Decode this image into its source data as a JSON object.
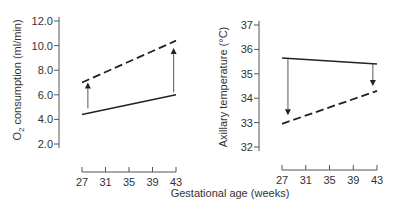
{
  "chart_data": [
    {
      "type": "line",
      "title": "",
      "xlabel": "Gestational age (weeks)",
      "ylabel": "O2 consumption (ml/min)",
      "ylabel_display": [
        "O",
        "2",
        " consumption (ml/min)"
      ],
      "x_ticks": [
        "27",
        "31",
        "35",
        "39",
        "43"
      ],
      "y_ticks": [
        "2.0",
        "4.0",
        "6.0",
        "8.0",
        "10.0",
        "12.0"
      ],
      "xlim": [
        27,
        43
      ],
      "ylim": [
        2.0,
        12.0
      ],
      "grid": false,
      "legend": null,
      "series": [
        {
          "name": "solid",
          "style": "solid",
          "x": [
            27,
            43
          ],
          "values": [
            4.4,
            6.0
          ]
        },
        {
          "name": "dashed",
          "style": "dashed",
          "x": [
            27,
            43
          ],
          "values": [
            7.0,
            10.4
          ]
        }
      ],
      "annotations": [
        {
          "type": "arrow",
          "direction": "up",
          "x": 28,
          "from": 4.9,
          "to": 7.0
        },
        {
          "type": "arrow",
          "direction": "up",
          "x": 42.6,
          "from": 6.2,
          "to": 9.8
        }
      ]
    },
    {
      "type": "line",
      "title": "",
      "xlabel": "Gestational age (weeks)",
      "ylabel": "Axillary temperature (°C)",
      "x_ticks": [
        "27",
        "31",
        "35",
        "39",
        "43"
      ],
      "y_ticks": [
        "32",
        "33",
        "34",
        "35",
        "36",
        "37"
      ],
      "xlim": [
        27,
        43
      ],
      "ylim": [
        32,
        37
      ],
      "grid": false,
      "legend": null,
      "series": [
        {
          "name": "solid",
          "style": "solid",
          "x": [
            27,
            43
          ],
          "values": [
            35.65,
            35.4
          ]
        },
        {
          "name": "dashed",
          "style": "dashed",
          "x": [
            27,
            43
          ],
          "values": [
            32.95,
            34.3
          ]
        }
      ],
      "annotations": [
        {
          "type": "arrow",
          "direction": "down",
          "x": 28,
          "from": 35.6,
          "to": 33.3
        },
        {
          "type": "arrow",
          "direction": "down",
          "x": 42.3,
          "from": 35.4,
          "to": 34.5
        }
      ]
    }
  ],
  "shared_xlabel": "Gestational age (weeks)"
}
